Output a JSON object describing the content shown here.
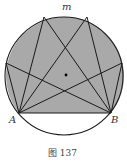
{
  "figure": {
    "caption": "图 137",
    "labels": {
      "arc": "m",
      "A": "A",
      "B": "B"
    },
    "colors": {
      "shade": "#a9a9a9",
      "line": "#1a1a1a",
      "background": "#ffffff"
    },
    "circle": {
      "cx": 64,
      "cy": 76,
      "r": 59
    },
    "points": {
      "A": [
        19,
        113
      ],
      "B": [
        111,
        113
      ],
      "P1": [
        6,
        63
      ],
      "P2": [
        44,
        17
      ],
      "P3": [
        87,
        17
      ],
      "P4": [
        122,
        63
      ]
    },
    "center_dot": [
      66,
      75
    ]
  }
}
